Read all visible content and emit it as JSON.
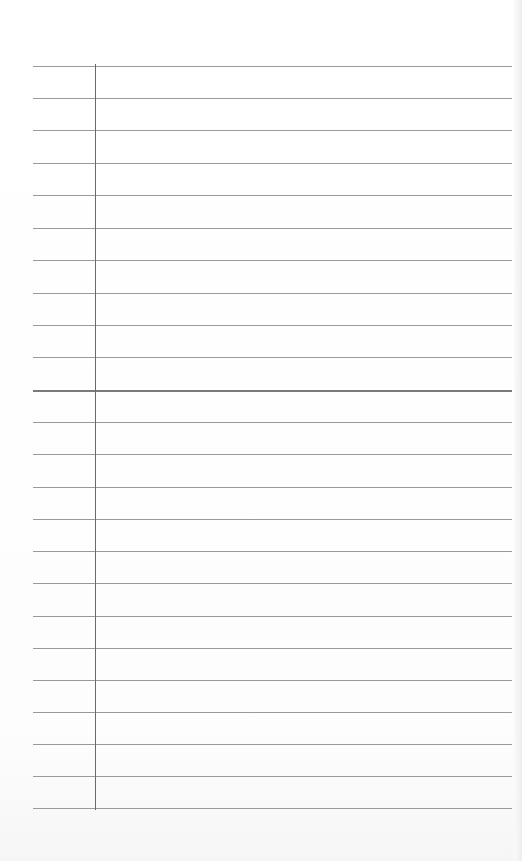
{
  "paper": {
    "type": "lined notebook paper",
    "background_color": "#fefefe",
    "rule_color": "#9a9a9a",
    "margin_color": "#6a6a6a",
    "rule_count": 24,
    "rule_y_positions": [
      66,
      98,
      130,
      163,
      195,
      228,
      260,
      293,
      325,
      357,
      390,
      422,
      454,
      487,
      519,
      551,
      583,
      616,
      648,
      680,
      712,
      744,
      776,
      808
    ],
    "emphasized_rule_index": 10,
    "margin_x": 95
  }
}
